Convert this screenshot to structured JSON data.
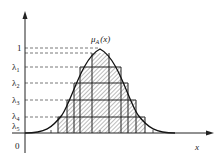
{
  "figure": {
    "curve_label": "μ",
    "curve_label_sub": "A",
    "curve_label_arg": "(x)",
    "x_axis_label": "x",
    "origin_label": "0",
    "y_labels": [
      {
        "text": "1",
        "sub": ""
      },
      {
        "text": "λ",
        "sub": "1"
      },
      {
        "text": "λ",
        "sub": "2"
      },
      {
        "text": "λ",
        "sub": "3"
      },
      {
        "text": "λ",
        "sub": "4"
      },
      {
        "text": "λ",
        "sub": "5"
      }
    ],
    "colors": {
      "line": "#222222",
      "dash": "#555555",
      "hatch": "#444444",
      "background": "#ffffff"
    }
  }
}
